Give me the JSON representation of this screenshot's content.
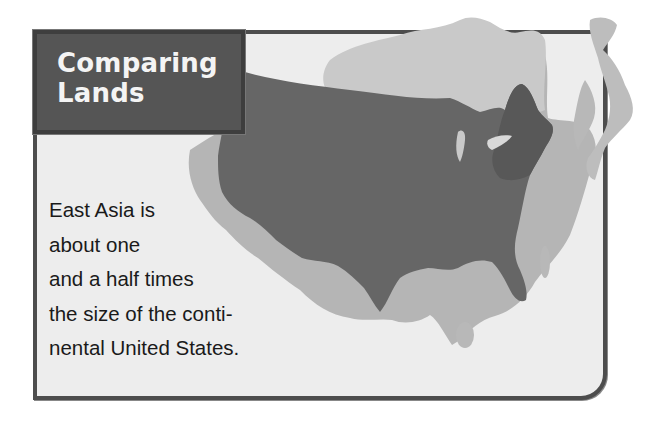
{
  "figure": {
    "title_lines": [
      "Comparing",
      "Lands"
    ],
    "caption_lines": [
      "East Asia is",
      "about one",
      "and a half times",
      "the size of the conti-",
      "nental United States."
    ]
  },
  "map": {
    "layers": [
      {
        "name": "East Asia outline (mainland)",
        "shade": "#b5b5b5"
      },
      {
        "name": "China interior / Mongolia",
        "shade": "#c9c9c9"
      },
      {
        "name": "Japan",
        "shade": "#bdbdbd"
      },
      {
        "name": "Continental United States overlay",
        "shade": "#666666"
      },
      {
        "name": "U.S. Northeast region",
        "shade": "#5a5a5a"
      }
    ]
  },
  "colors": {
    "card_background": "#ededed",
    "card_border": "#4d4d4d",
    "title_background": "#555555",
    "title_text": "#f4f4f4",
    "caption_text": "#1a1a1a"
  }
}
